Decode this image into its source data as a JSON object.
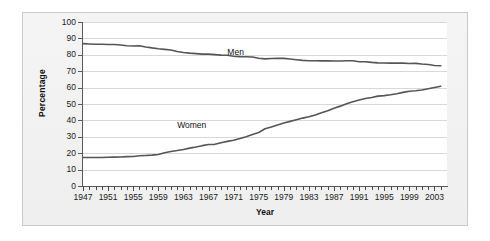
{
  "chart_data": {
    "type": "line",
    "title": "",
    "xlabel": "Year",
    "ylabel": "Percentage",
    "xlim": [
      1947,
      2005
    ],
    "ylim": [
      0,
      100
    ],
    "grid": true,
    "legend_position": "inline-labels",
    "y_ticks": [
      100,
      90,
      80,
      70,
      60,
      50,
      40,
      30,
      20,
      10,
      0
    ],
    "x_tick_labels": [
      "1947",
      "1951",
      "1955",
      "1959",
      "1963",
      "1967",
      "1971",
      "1975",
      "1979",
      "1983",
      "1987",
      "1991",
      "1995",
      "1999",
      "2003"
    ],
    "x_minor_tick_step": 1,
    "x_major_tick_step": 4,
    "annotations": [
      {
        "text": "Men",
        "x": 1970,
        "y": 82
      },
      {
        "text": "Women",
        "x": 1962,
        "y": 37
      }
    ],
    "series": [
      {
        "name": "Men",
        "color": "#555555",
        "x": [
          1947,
          1948,
          1949,
          1950,
          1951,
          1952,
          1953,
          1954,
          1955,
          1956,
          1957,
          1958,
          1959,
          1960,
          1961,
          1962,
          1963,
          1964,
          1965,
          1966,
          1967,
          1968,
          1969,
          1970,
          1971,
          1972,
          1973,
          1974,
          1975,
          1976,
          1977,
          1978,
          1979,
          1980,
          1981,
          1982,
          1983,
          1984,
          1985,
          1986,
          1987,
          1988,
          1989,
          1990,
          1991,
          1992,
          1993,
          1994,
          1995,
          1996,
          1997,
          1998,
          1999,
          2000,
          2001,
          2002,
          2003,
          2004
        ],
        "values": [
          86.8,
          86.6,
          86.4,
          86.4,
          86.3,
          86.3,
          86.0,
          85.5,
          85.4,
          85.5,
          84.8,
          84.2,
          83.7,
          83.3,
          82.9,
          82.0,
          81.4,
          81.0,
          80.7,
          80.4,
          80.4,
          80.1,
          79.8,
          79.7,
          79.1,
          78.9,
          78.8,
          78.7,
          77.9,
          77.5,
          77.7,
          77.9,
          77.8,
          77.4,
          77.0,
          76.6,
          76.4,
          76.4,
          76.3,
          76.3,
          76.2,
          76.2,
          76.4,
          76.4,
          75.8,
          75.8,
          75.4,
          75.1,
          75.0,
          74.9,
          75.0,
          74.9,
          74.7,
          74.8,
          74.4,
          74.1,
          73.5,
          73.3
        ]
      },
      {
        "name": "Women",
        "color": "#555555",
        "x": [
          1947,
          1948,
          1949,
          1950,
          1951,
          1952,
          1953,
          1954,
          1955,
          1956,
          1957,
          1958,
          1959,
          1960,
          1961,
          1962,
          1963,
          1964,
          1965,
          1966,
          1967,
          1968,
          1969,
          1970,
          1971,
          1972,
          1973,
          1974,
          1975,
          1976,
          1977,
          1978,
          1979,
          1980,
          1981,
          1982,
          1983,
          1984,
          1985,
          1986,
          1987,
          1988,
          1989,
          1990,
          1991,
          1992,
          1993,
          1994,
          1995,
          1996,
          1997,
          1998,
          1999,
          2000,
          2001,
          2002,
          2003,
          2004
        ],
        "values": [
          17.4,
          17.4,
          17.4,
          17.4,
          17.5,
          17.6,
          17.7,
          17.9,
          18.0,
          18.4,
          18.6,
          18.8,
          19.2,
          20.3,
          21.0,
          21.6,
          22.3,
          23.1,
          23.8,
          24.6,
          25.3,
          25.4,
          26.4,
          27.2,
          27.9,
          28.9,
          30.0,
          31.4,
          32.6,
          34.9,
          36.0,
          37.2,
          38.4,
          39.4,
          40.4,
          41.4,
          42.2,
          43.3,
          44.7,
          45.9,
          47.4,
          48.7,
          50.1,
          51.4,
          52.4,
          53.4,
          54.0,
          54.8,
          55.1,
          55.6,
          56.3,
          57.1,
          57.8,
          58.1,
          58.5,
          59.3,
          60.1,
          60.8
        ]
      }
    ]
  },
  "axes": {
    "y_title": "Percentage",
    "x_title": "Year"
  }
}
